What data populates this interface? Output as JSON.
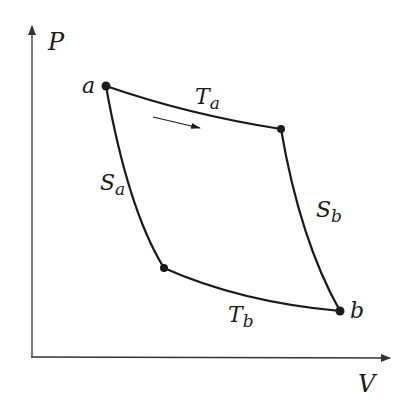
{
  "diagram": {
    "type": "PV cycle (Carnot-like)",
    "axes": {
      "y_label": "P",
      "x_label": "V"
    },
    "points": {
      "a": {
        "label": "a",
        "x": 106,
        "y": 86
      },
      "c": {
        "label": "",
        "x": 281,
        "y": 129
      },
      "b": {
        "label": "b",
        "x": 340,
        "y": 311
      },
      "d": {
        "label": "",
        "x": 164,
        "y": 268
      }
    },
    "curves": [
      {
        "id": "isotherm-a",
        "label_main": "T",
        "label_sub": "a",
        "from": "a",
        "to": "c"
      },
      {
        "id": "adiabat-b",
        "label_main": "S",
        "label_sub": "b",
        "from": "c",
        "to": "b"
      },
      {
        "id": "isotherm-b",
        "label_main": "T",
        "label_sub": "b",
        "from": "d",
        "to": "b"
      },
      {
        "id": "adiabat-a",
        "label_main": "S",
        "label_sub": "a",
        "from": "a",
        "to": "d"
      }
    ],
    "direction_arrow": "clockwise (a → along Ta)",
    "colors": {
      "line": "#1a1a1a",
      "axis": "#333333",
      "background": "#ffffff"
    }
  }
}
